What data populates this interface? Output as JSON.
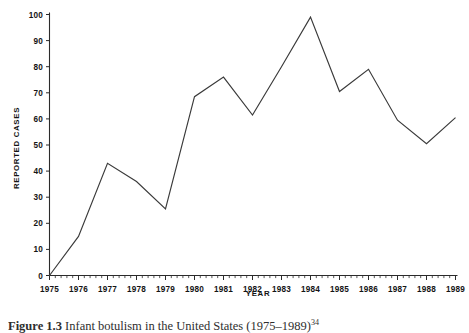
{
  "figure": {
    "caption_prefix": "Figure 1.3",
    "caption_text": "Infant botulism in the United States (1975–1989)",
    "caption_superscript": "34"
  },
  "chart_data": {
    "type": "line",
    "title": "",
    "xlabel": "YEAR",
    "ylabel": "REPORTED CASES",
    "categories": [
      1975,
      1976,
      1977,
      1978,
      1979,
      1980,
      1981,
      1982,
      1983,
      1984,
      1985,
      1986,
      1987,
      1988,
      1989
    ],
    "values": [
      0,
      15,
      43,
      36,
      25.5,
      68.5,
      76,
      61.5,
      80,
      99,
      70.5,
      79,
      59.5,
      50.5,
      60.5
    ],
    "series": [
      {
        "name": "Reported cases",
        "values": [
          0,
          15,
          43,
          36,
          25.5,
          68.5,
          76,
          61.5,
          80,
          99,
          70.5,
          79,
          59.5,
          50.5,
          60.5
        ]
      }
    ],
    "xlim": [
      1975,
      1989
    ],
    "ylim": [
      0,
      100
    ],
    "ytick_labels": [
      "0",
      "10",
      "20",
      "30",
      "40",
      "50",
      "60",
      "70",
      "80",
      "90",
      "100"
    ],
    "ytick_values": [
      0,
      10,
      20,
      30,
      40,
      50,
      60,
      70,
      80,
      90,
      100
    ],
    "xtick_labels": [
      "1975",
      "1976",
      "1977",
      "1978",
      "1979",
      "1980",
      "1981",
      "1982",
      "1983",
      "1984",
      "1985",
      "1986",
      "1987",
      "1988",
      "1989"
    ],
    "x_minor_ticks_per_interval": 5,
    "grid": false,
    "legend": false,
    "legend_position": "none",
    "line_color": "#3a3a3a",
    "axis_color": "#2b2b2b",
    "background_color": "#ffffff"
  }
}
